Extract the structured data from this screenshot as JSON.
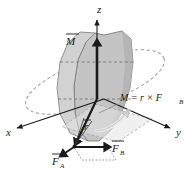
{
  "figure": {
    "background_color": "#ffffff",
    "ink_color": "#1a1a1a",
    "body_fill": "#c9c9c9",
    "body_fill_light": "#d9d9d9",
    "body_fill_dark": "#b0b0b0",
    "dashed_color": "#8a8a8a",
    "curved_arrow_color": "#f2f2f2",
    "width": 190,
    "height": 172
  },
  "axes": [
    {
      "name": "z-axis",
      "label": "z",
      "direction": "up",
      "label_x": 97,
      "label_y": 13
    },
    {
      "name": "x-axis",
      "label": "x",
      "direction": "down-left",
      "label_x": 6,
      "label_y": 133
    },
    {
      "name": "y-axis",
      "label": "y",
      "direction": "down-right",
      "label_x": 177,
      "label_y": 133
    }
  ],
  "vectors": [
    {
      "name": "moment-vector",
      "label": "M",
      "overbar": true,
      "label_x": 68,
      "label_y": 42
    },
    {
      "name": "position-vector",
      "label": "r",
      "overbar": true,
      "label_x": 84,
      "label_y": 128
    },
    {
      "name": "force-a-vector",
      "label": "F",
      "subscript": "A",
      "overbar": true,
      "label_x": 56,
      "label_y": 162
    },
    {
      "name": "force-b-vector",
      "label": "F",
      "subscript": "B",
      "overbar": true,
      "label_x": 113,
      "label_y": 150
    }
  ],
  "equation": {
    "name": "moment-equation",
    "text": "M = r × F",
    "subscript": "B",
    "full": "M = r × F_B",
    "label_x": 120,
    "label_y": 101
  },
  "annotations": {
    "rotation_ellipse": "dashed-rotation-ellipse",
    "curved_arrow": "curved-rotation-arrow",
    "force_parallelogram": "dotted-force-parallelogram",
    "body": "shaded-rigid-body"
  }
}
